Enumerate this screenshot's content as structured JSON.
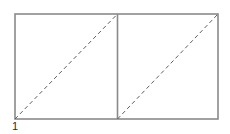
{
  "figure": {
    "label": "1",
    "canvas": {
      "width": 230,
      "height": 134,
      "background": "#ffffff"
    },
    "style": {
      "solid_stroke_color": "#8a8a8a",
      "dashed_stroke_color": "#5f5f5f",
      "solid_stroke_width": 1.6,
      "dashed_stroke_width": 1,
      "dash_pattern": "4,3",
      "label_color": "#2b2b2b"
    },
    "rectangle": {
      "x": 15,
      "y": 14,
      "width": 203,
      "height": 105
    },
    "divider": {
      "x1": 117.5,
      "y1": 14,
      "x2": 117.5,
      "y2": 119
    },
    "diagonals": [
      {
        "x1": 15,
        "y1": 119,
        "x2": 117.5,
        "y2": 14
      },
      {
        "x1": 117.5,
        "y1": 119,
        "x2": 218,
        "y2": 14
      }
    ]
  }
}
